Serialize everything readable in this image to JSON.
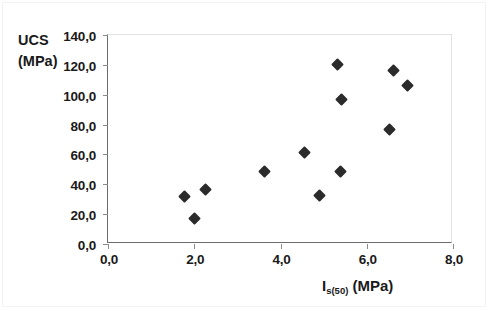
{
  "chart_data": {
    "type": "scatter",
    "title": "",
    "xlabel_parts": {
      "main": "I",
      "sub": "s(50)",
      "tail": " (MPa)"
    },
    "xlabel": "Is(50) (MPa)",
    "ylabel_line1": "UCS",
    "ylabel_line2": "(MPa)",
    "ylabel": "UCS (MPa)",
    "xlim": [
      0.0,
      8.0
    ],
    "ylim": [
      0.0,
      140.0
    ],
    "xticks": [
      0.0,
      2.0,
      4.0,
      6.0,
      8.0
    ],
    "yticks": [
      0.0,
      20.0,
      40.0,
      60.0,
      80.0,
      100.0,
      120.0,
      140.0
    ],
    "xtick_labels": [
      "0,0",
      "2,0",
      "4,0",
      "6,0",
      "8,0"
    ],
    "ytick_labels": [
      "0,0",
      "20,0",
      "40,0",
      "60,0",
      "80,0",
      "100,0",
      "120,0",
      "140,0"
    ],
    "decimal_separator": ",",
    "grid": false,
    "legend": false,
    "marker": "diamond",
    "marker_color": "#2b2b2b",
    "axis_color": "#6b6b6b",
    "background": "#ffffff",
    "points": [
      {
        "x": 1.77,
        "y": 31.5
      },
      {
        "x": 2.0,
        "y": 17.0
      },
      {
        "x": 2.25,
        "y": 36.5
      },
      {
        "x": 3.63,
        "y": 48.5
      },
      {
        "x": 4.55,
        "y": 61.5
      },
      {
        "x": 4.9,
        "y": 32.5
      },
      {
        "x": 5.33,
        "y": 120.5
      },
      {
        "x": 5.42,
        "y": 96.5
      },
      {
        "x": 5.4,
        "y": 48.5
      },
      {
        "x": 6.52,
        "y": 77.0
      },
      {
        "x": 6.62,
        "y": 116.5
      },
      {
        "x": 6.95,
        "y": 106.5
      }
    ]
  }
}
